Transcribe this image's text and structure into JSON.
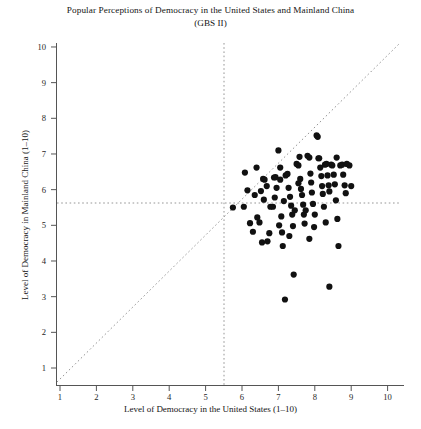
{
  "chart_data": {
    "type": "scatter",
    "title": "Popular Perceptions of Democracy in the United States and Mainland China",
    "subtitle": "(GBS II)",
    "xlabel": "Level of Democracy in the United States (1–10)",
    "ylabel": "Level of Democracy in Mainland China (1–10)",
    "xlim": [
      0.5,
      10.6
    ],
    "ylim": [
      0.5,
      10.5
    ],
    "xticks": [
      1,
      2,
      3,
      4,
      5,
      6,
      7,
      8,
      9,
      10
    ],
    "yticks": [
      1,
      2,
      3,
      4,
      5,
      6,
      7,
      8,
      9,
      10
    ],
    "grid": false,
    "legend": "none",
    "marker_color": "#111111",
    "marker_size": 3.1,
    "reference_lines": [
      {
        "name": "diagonal-45",
        "type": "diagonal",
        "from": [
          0.6,
          0.6
        ],
        "to": [
          10.5,
          10.5
        ],
        "style": "dotted"
      },
      {
        "name": "vertical-midpoint",
        "type": "vertical",
        "x": 5.5,
        "style": "dotted"
      },
      {
        "name": "horizontal-midpoint",
        "type": "horizontal",
        "y": 5.5,
        "style": "dotted"
      }
    ],
    "points": [
      [
        5.75,
        5.5
      ],
      [
        6.05,
        5.52
      ],
      [
        6.15,
        5.98
      ],
      [
        6.4,
        6.62
      ],
      [
        6.22,
        5.06
      ],
      [
        6.3,
        4.82
      ],
      [
        6.42,
        5.22
      ],
      [
        6.48,
        5.08
      ],
      [
        6.52,
        5.96
      ],
      [
        6.58,
        6.3
      ],
      [
        6.62,
        6.28
      ],
      [
        6.55,
        4.52
      ],
      [
        6.7,
        4.55
      ],
      [
        6.78,
        5.52
      ],
      [
        6.85,
        5.52
      ],
      [
        6.88,
        6.34
      ],
      [
        6.92,
        6.35
      ],
      [
        6.95,
        6.05
      ],
      [
        7.0,
        7.1
      ],
      [
        7.05,
        6.28
      ],
      [
        7.08,
        5.25
      ],
      [
        7.02,
        5.0
      ],
      [
        7.1,
        4.8
      ],
      [
        7.12,
        4.42
      ],
      [
        7.2,
        6.4
      ],
      [
        7.25,
        6.44
      ],
      [
        7.28,
        6.05
      ],
      [
        7.32,
        5.8
      ],
      [
        7.35,
        5.55
      ],
      [
        7.38,
        5.3
      ],
      [
        7.4,
        4.98
      ],
      [
        7.42,
        3.62
      ],
      [
        7.18,
        2.92
      ],
      [
        7.5,
        6.72
      ],
      [
        7.55,
        6.68
      ],
      [
        7.58,
        6.92
      ],
      [
        7.6,
        6.3
      ],
      [
        7.62,
        6.02
      ],
      [
        7.65,
        5.85
      ],
      [
        7.68,
        5.58
      ],
      [
        7.7,
        5.3
      ],
      [
        7.72,
        5.05
      ],
      [
        7.8,
        6.95
      ],
      [
        7.85,
        6.9
      ],
      [
        7.88,
        6.45
      ],
      [
        7.9,
        6.2
      ],
      [
        7.92,
        5.92
      ],
      [
        7.95,
        5.6
      ],
      [
        7.98,
        4.95
      ],
      [
        8.05,
        7.52
      ],
      [
        8.08,
        7.48
      ],
      [
        8.1,
        6.88
      ],
      [
        8.15,
        6.62
      ],
      [
        8.18,
        6.38
      ],
      [
        8.2,
        6.1
      ],
      [
        8.22,
        5.88
      ],
      [
        8.25,
        5.52
      ],
      [
        8.28,
        6.7
      ],
      [
        8.32,
        6.72
      ],
      [
        8.35,
        6.4
      ],
      [
        8.38,
        6.12
      ],
      [
        8.4,
        5.95
      ],
      [
        8.45,
        6.7
      ],
      [
        8.48,
        6.68
      ],
      [
        8.52,
        6.42
      ],
      [
        8.55,
        6.15
      ],
      [
        8.58,
        5.7
      ],
      [
        8.62,
        5.18
      ],
      [
        8.65,
        4.42
      ],
      [
        8.4,
        3.28
      ],
      [
        8.7,
        6.68
      ],
      [
        8.75,
        6.7
      ],
      [
        8.78,
        6.42
      ],
      [
        8.82,
        6.12
      ],
      [
        8.85,
        5.9
      ],
      [
        8.88,
        6.72
      ],
      [
        8.95,
        6.68
      ],
      [
        9.0,
        6.1
      ],
      [
        6.08,
        6.48
      ],
      [
        6.35,
        5.85
      ],
      [
        6.68,
        6.1
      ],
      [
        6.9,
        5.78
      ],
      [
        7.15,
        5.68
      ],
      [
        7.45,
        5.42
      ],
      [
        7.75,
        5.42
      ],
      [
        8.0,
        5.3
      ],
      [
        8.3,
        5.08
      ],
      [
        6.75,
        4.78
      ],
      [
        7.3,
        4.7
      ],
      [
        7.85,
        4.62
      ],
      [
        6.6,
        5.72
      ],
      [
        7.05,
        6.62
      ],
      [
        7.55,
        6.18
      ],
      [
        8.12,
        6.88
      ],
      [
        8.6,
        6.9
      ]
    ]
  }
}
